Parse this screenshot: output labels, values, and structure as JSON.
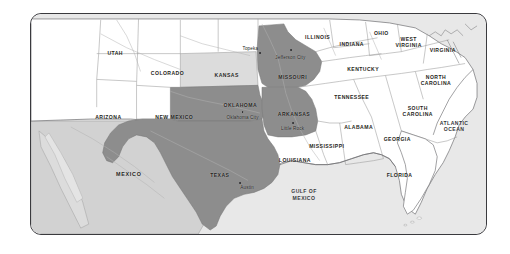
{
  "map": {
    "title": "South Central United States regional map",
    "frame": {
      "border_color": "#3a3a3e",
      "corner_radius": "11px"
    },
    "palette": {
      "background": "#ffffff",
      "land_plain": "#ffffff",
      "water": "#e8e8e8",
      "foreign_land": "#d2d2d2",
      "highlight_dark": "#8d8d8d",
      "highlight_light": "#dcdcdc",
      "border_line": "#9a9a9a",
      "coast_line": "#6f6f72",
      "label_text": "#1e1e20"
    },
    "legend_note": "Texas, Oklahoma, Missouri and Arkansas are shaded dark; Kansas is shaded light",
    "highlighted_states": [
      {
        "name": "TEXAS",
        "shade": "dark",
        "capital": "Austin"
      },
      {
        "name": "OKLAHOMA",
        "shade": "dark",
        "capital": "Oklahoma City"
      },
      {
        "name": "MISSOURI",
        "shade": "dark",
        "capital": "Jefferson City"
      },
      {
        "name": "ARKANSAS",
        "shade": "dark",
        "capital": "Little Rock"
      },
      {
        "name": "KANSAS",
        "shade": "light",
        "capital": "Topeka"
      }
    ],
    "state_labels": [
      {
        "name": "UTAH",
        "x": 18.5,
        "y": 17.5,
        "lines": [
          "UTAH"
        ]
      },
      {
        "name": "COLORADO",
        "x": 30.0,
        "y": 27.0,
        "lines": [
          "COLORADO"
        ]
      },
      {
        "name": "ARIZONA",
        "x": 17.0,
        "y": 47.0,
        "lines": [
          "ARIZONA"
        ]
      },
      {
        "name": "NEW MEXICO",
        "x": 31.5,
        "y": 47.0,
        "lines": [
          "NEW MEXICO"
        ]
      },
      {
        "name": "KANSAS",
        "x": 43.0,
        "y": 27.5,
        "lines": [
          "KANSAS"
        ]
      },
      {
        "name": "OKLAHOMA",
        "x": 46.0,
        "y": 41.5,
        "lines": [
          "OKLAHOMA"
        ]
      },
      {
        "name": "TEXAS",
        "x": 41.5,
        "y": 73.0,
        "lines": [
          "TEXAS"
        ]
      },
      {
        "name": "MISSOURI",
        "x": 57.5,
        "y": 28.5,
        "lines": [
          "MISSOURI"
        ]
      },
      {
        "name": "ARKANSAS",
        "x": 57.8,
        "y": 45.5,
        "lines": [
          "ARKANSAS"
        ]
      },
      {
        "name": "LOUISIANA",
        "x": 58.0,
        "y": 66.5,
        "lines": [
          "LOUISIANA"
        ]
      },
      {
        "name": "MISSISSIPPI",
        "x": 65.0,
        "y": 60.0,
        "lines": [
          "MISSISSIPPI"
        ]
      },
      {
        "name": "ALABAMA",
        "x": 72.0,
        "y": 51.5,
        "lines": [
          "ALABAMA"
        ]
      },
      {
        "name": "GEORGIA",
        "x": 80.5,
        "y": 57.0,
        "lines": [
          "GEORGIA"
        ]
      },
      {
        "name": "FLORIDA",
        "x": 81.0,
        "y": 73.0,
        "lines": [
          "FLORIDA"
        ]
      },
      {
        "name": "TENNESSEE",
        "x": 70.5,
        "y": 37.5,
        "lines": [
          "TENNESSEE"
        ]
      },
      {
        "name": "KENTUCKY",
        "x": 73.0,
        "y": 25.0,
        "lines": [
          "KENTUCKY"
        ]
      },
      {
        "name": "ILLINOIS",
        "x": 63.0,
        "y": 10.5,
        "lines": [
          "ILLINOIS"
        ]
      },
      {
        "name": "INDIANA",
        "x": 70.5,
        "y": 13.5,
        "lines": [
          "INDIANA"
        ]
      },
      {
        "name": "OHIO",
        "x": 77.0,
        "y": 8.5,
        "lines": [
          "OHIO"
        ]
      },
      {
        "name": "WEST VIRGINIA",
        "x": 83.0,
        "y": 12.5,
        "lines": [
          "WEST",
          "VIRGINIA"
        ]
      },
      {
        "name": "VIRGINIA",
        "x": 90.5,
        "y": 16.5,
        "lines": [
          "VIRGINIA"
        ]
      },
      {
        "name": "NORTH CAROLINA",
        "x": 89.0,
        "y": 30.0,
        "lines": [
          "NORTH",
          "CAROLINA"
        ]
      },
      {
        "name": "SOUTH CAROLINA",
        "x": 85.0,
        "y": 44.0,
        "lines": [
          "SOUTH",
          "CAROLINA"
        ]
      }
    ],
    "country_labels": [
      {
        "name": "MEXICO",
        "x": 21.5,
        "y": 72.5
      }
    ],
    "water_labels": [
      {
        "name": "GULF OF MEXICO",
        "x": 60.0,
        "y": 82.0,
        "lines": [
          "GULF OF",
          "MEXICO"
        ]
      },
      {
        "name": "ATLANTIC OCEAN",
        "x": 93.0,
        "y": 51.0,
        "lines": [
          "ATLANTIC",
          "OCEAN"
        ]
      }
    ],
    "city_labels": [
      {
        "name": "Topeka",
        "x": 48.2,
        "y": 15.5,
        "dot_x": 50.4,
        "dot_y": 17.6
      },
      {
        "name": "Jefferson City",
        "x": 57.0,
        "y": 19.5,
        "dot_x": 57.2,
        "dot_y": 16.5
      },
      {
        "name": "Oklahoma City",
        "x": 46.5,
        "y": 47.0,
        "dot_x": 46.5,
        "dot_y": 44.6
      },
      {
        "name": "Little Rock",
        "x": 57.5,
        "y": 52.0,
        "dot_x": 57.6,
        "dot_y": 49.6
      },
      {
        "name": "Austin",
        "x": 47.5,
        "y": 78.5,
        "dot_x": 46.0,
        "dot_y": 77.0
      }
    ]
  }
}
